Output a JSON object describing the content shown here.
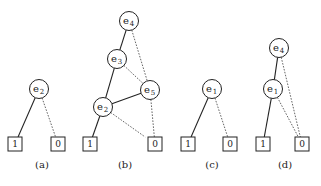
{
  "figure": {
    "panels": [
      {
        "caption": "(a)",
        "nodes": [
          {
            "id": "e2",
            "base": "e",
            "sub": "2",
            "x": 39,
            "y": 89
          }
        ],
        "terminals": [
          {
            "id": "t1",
            "label": "1",
            "x": 15,
            "y": 144
          },
          {
            "id": "t0",
            "label": "0",
            "x": 58,
            "y": 144
          }
        ],
        "edges": [
          {
            "from": "e2",
            "to": "t1",
            "type": "solid"
          },
          {
            "from": "e2",
            "to": "t0",
            "type": "dashed"
          }
        ]
      },
      {
        "caption": "(b)",
        "nodes": [
          {
            "id": "e4",
            "base": "e",
            "sub": "4",
            "x": 129,
            "y": 21
          },
          {
            "id": "e3",
            "base": "e",
            "sub": "3",
            "x": 117,
            "y": 59
          },
          {
            "id": "e5",
            "base": "e",
            "sub": "5",
            "x": 150,
            "y": 90
          },
          {
            "id": "e2",
            "base": "e",
            "sub": "2",
            "x": 103,
            "y": 107
          }
        ],
        "terminals": [
          {
            "id": "t1",
            "label": "1",
            "x": 90,
            "y": 144
          },
          {
            "id": "t0",
            "label": "0",
            "x": 155,
            "y": 144
          }
        ],
        "edges": [
          {
            "from": "e4",
            "to": "e3",
            "type": "solid"
          },
          {
            "from": "e4",
            "to": "e5",
            "type": "dashed"
          },
          {
            "from": "e3",
            "to": "e2",
            "type": "solid"
          },
          {
            "from": "e3",
            "to": "e5",
            "type": "dashed"
          },
          {
            "from": "e5",
            "to": "e2",
            "type": "solid"
          },
          {
            "from": "e5",
            "to": "t0",
            "type": "dashed"
          },
          {
            "from": "e2",
            "to": "t1",
            "type": "solid"
          },
          {
            "from": "e2",
            "to": "t0",
            "type": "dashed"
          }
        ]
      },
      {
        "caption": "(c)",
        "nodes": [
          {
            "id": "e1",
            "base": "e",
            "sub": "1",
            "x": 212,
            "y": 89
          }
        ],
        "terminals": [
          {
            "id": "t1",
            "label": "1",
            "x": 188,
            "y": 144
          },
          {
            "id": "t0",
            "label": "0",
            "x": 230,
            "y": 144
          }
        ],
        "edges": [
          {
            "from": "e1",
            "to": "t1",
            "type": "solid"
          },
          {
            "from": "e1",
            "to": "t0",
            "type": "dashed"
          }
        ]
      },
      {
        "caption": "(d)",
        "nodes": [
          {
            "id": "e4",
            "base": "e",
            "sub": "4",
            "x": 279,
            "y": 48
          },
          {
            "id": "e1",
            "base": "e",
            "sub": "1",
            "x": 273,
            "y": 89
          }
        ],
        "terminals": [
          {
            "id": "t1",
            "label": "1",
            "x": 263,
            "y": 144
          },
          {
            "id": "t0",
            "label": "0",
            "x": 302,
            "y": 144
          }
        ],
        "edges": [
          {
            "from": "e4",
            "to": "e1",
            "type": "solid"
          },
          {
            "from": "e4",
            "to": "t0",
            "type": "dashed"
          },
          {
            "from": "e1",
            "to": "t1",
            "type": "solid"
          },
          {
            "from": "e1",
            "to": "t0",
            "type": "dashed"
          }
        ]
      }
    ],
    "caption_positions": [
      {
        "x": 42,
        "y": 168
      },
      {
        "x": 125,
        "y": 168
      },
      {
        "x": 212,
        "y": 168
      },
      {
        "x": 285,
        "y": 168
      }
    ]
  }
}
